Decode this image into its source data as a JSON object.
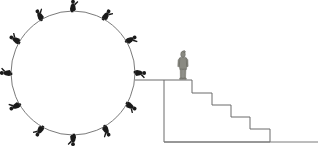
{
  "illustration": {
    "title": "Circle of figures beside a staircase",
    "background_color": "#ffffff",
    "width": 320,
    "height": 160
  },
  "colors": {
    "stroke": "#6b6b6b",
    "circle_stroke": "#7a7a7a",
    "figure_fill": "#1a1a1a",
    "walker_fill": "#8a8a82",
    "walker_outline": "#5d5d57",
    "ground": "#7a7a7a"
  },
  "circle": {
    "label": "wheel-of-figures",
    "center_x": 73,
    "center_y": 73,
    "radius": 62,
    "stroke_width": 1,
    "figure_count": 12,
    "figure_angles_deg": [
      -90,
      -60,
      -30,
      0,
      30,
      60,
      90,
      120,
      150,
      180,
      210,
      240
    ],
    "figures": [
      {
        "id": 1,
        "angle_deg": -90,
        "label": "figure-top"
      },
      {
        "id": 2,
        "angle_deg": -60,
        "label": "figure-upper-right"
      },
      {
        "id": 3,
        "angle_deg": -30,
        "label": "figure-right-upper"
      },
      {
        "id": 4,
        "angle_deg": 0,
        "label": "figure-right"
      },
      {
        "id": 5,
        "angle_deg": 30,
        "label": "figure-right-lower"
      },
      {
        "id": 6,
        "angle_deg": 60,
        "label": "figure-lower-right"
      },
      {
        "id": 7,
        "angle_deg": 90,
        "label": "figure-bottom"
      },
      {
        "id": 8,
        "angle_deg": 120,
        "label": "figure-lower-left"
      },
      {
        "id": 9,
        "angle_deg": 150,
        "label": "figure-left-lower"
      },
      {
        "id": 10,
        "angle_deg": 180,
        "label": "figure-left"
      },
      {
        "id": 11,
        "angle_deg": 210,
        "label": "figure-left-upper"
      },
      {
        "id": 12,
        "angle_deg": 240,
        "label": "figure-upper-left"
      }
    ]
  },
  "connector": {
    "label": "horizontal-link-line",
    "x1": 135,
    "y1": 80,
    "x2": 164,
    "y2": 80
  },
  "staircase": {
    "label": "descending-staircase",
    "step_count": 5,
    "top_platform_y": 80,
    "left_wall_x": 164,
    "ground_y": 142,
    "steps": [
      {
        "index": 1,
        "tread_x_start": 164,
        "tread_x_end": 192,
        "tread_y": 80
      },
      {
        "index": 2,
        "tread_x_start": 192,
        "tread_x_end": 212,
        "tread_y": 93
      },
      {
        "index": 3,
        "tread_x_start": 212,
        "tread_x_end": 231,
        "tread_y": 105
      },
      {
        "index": 4,
        "tread_x_start": 231,
        "tread_x_end": 250,
        "tread_y": 117
      },
      {
        "index": 5,
        "tread_x_start": 250,
        "tread_x_end": 270,
        "tread_y": 129
      }
    ]
  },
  "ground_line": {
    "label": "ground-baseline",
    "x1": 164,
    "y1": 142,
    "x2": 318,
    "y2": 142
  },
  "walker": {
    "label": "person-on-platform",
    "x": 183,
    "y": 79,
    "height": 28,
    "description": "standing person at top of stairs"
  }
}
